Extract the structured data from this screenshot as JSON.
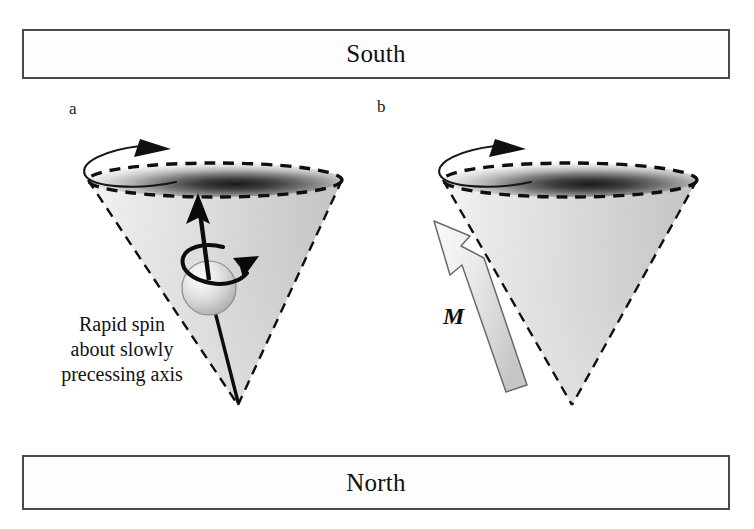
{
  "figure": {
    "type": "precession-diagram",
    "background_color": "#ffffff"
  },
  "poles": {
    "south": {
      "label": "South",
      "position": "top",
      "border_color": "#4a4a4a",
      "fill_color": "#fdfdfd"
    },
    "north": {
      "label": "North",
      "position": "bottom",
      "border_color": "#4a4a4a",
      "fill_color": "#fdfdfd"
    }
  },
  "panels": [
    {
      "id": "a",
      "letter": "a",
      "caption_lines": [
        "Rapid spin",
        "about slowly",
        "precessing axis"
      ],
      "elements": {
        "cone": "dashed-outline-cone",
        "ellipse": "dashed-precession-circle",
        "sphere": "spinning-sphere",
        "spin_axis_arrow": "black-solid-arrow",
        "spin_rotation_arrow": "small-curved-arrow",
        "precession_arrow": "curved-arc-arrow"
      }
    },
    {
      "id": "b",
      "letter": "b",
      "vector_label": "M",
      "elements": {
        "cone": "dashed-outline-cone",
        "ellipse": "dashed-precession-circle",
        "magnetization_arrow": "hollow-gray-block-arrow",
        "precession_arrow": "curved-arc-arrow"
      }
    }
  ],
  "colors": {
    "ink": "#111111",
    "box_border": "#4a4a4a",
    "cone_light": "#fbfbfb",
    "cone_mid": "#d2d2d2",
    "cone_dark": "#b4b4b4",
    "ellipse_dark": "#1c1c1c",
    "arrow_gray_light": "#f2f2f2",
    "arrow_gray_dark": "#c2c2c2",
    "arrow_outline": "#6f6f6f"
  }
}
